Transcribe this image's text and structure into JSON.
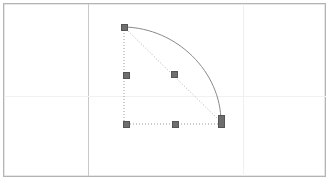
{
  "app": {
    "name": "vector-drawing-canvas",
    "background_color": "#ffffff"
  },
  "page": {
    "frame": {
      "x": 3,
      "y": 3,
      "width": 323,
      "height": 174
    },
    "border_color": "#b4b4b4",
    "fill_color": "#ffffff"
  },
  "guides": {
    "vertical": [
      {
        "name": "margin-guide-left",
        "x": 88,
        "color": "#c8c8c8",
        "prominent": true
      },
      {
        "name": "margin-guide-right",
        "x": 243,
        "color": "#f0f0f0",
        "prominent": false
      }
    ],
    "horizontal": [
      {
        "name": "margin-guide-middle",
        "y": 96,
        "color": "#f1f1f1",
        "prominent": false
      }
    ]
  },
  "shape": {
    "name": "quarter-arc-path",
    "type": "bezier-arc",
    "stroke_color": "#8a8a8a",
    "stroke_width": 1,
    "fill": "none",
    "start_point": {
      "x": 124,
      "y": 27
    },
    "end_point": {
      "x": 221,
      "y": 122
    },
    "control_point_1": {
      "x": 177,
      "y": 28
    },
    "control_point_2": {
      "x": 221,
      "y": 72
    }
  },
  "selection": {
    "name": "selection-overlay",
    "bounding_box": {
      "x": 124,
      "y": 27,
      "width": 97,
      "height": 97
    },
    "dotted_color": "#9a9a9a",
    "diagonal_guide": {
      "name": "chord-guide",
      "from": {
        "x": 124,
        "y": 27
      },
      "to": {
        "x": 221,
        "y": 122
      },
      "color": "#b0b0b0"
    },
    "handles": [
      {
        "name": "handle-top-left",
        "x": 124,
        "y": 27,
        "tall": false
      },
      {
        "name": "handle-middle-left",
        "x": 126,
        "y": 75,
        "tall": false
      },
      {
        "name": "handle-bottom-left",
        "x": 126,
        "y": 124,
        "tall": false
      },
      {
        "name": "handle-bottom-middle",
        "x": 175,
        "y": 124,
        "tall": false
      },
      {
        "name": "handle-bottom-right",
        "x": 221,
        "y": 121,
        "tall": true
      },
      {
        "name": "handle-chord-midpoint",
        "x": 174,
        "y": 74,
        "tall": false
      }
    ]
  },
  "colors": {
    "handle_fill": "#6e6e6e",
    "handle_border": "#555555",
    "curve_stroke": "#8a8a8a",
    "frame_border": "#b4b4b4",
    "guide_strong": "#c8c8c8",
    "guide_faint": "#f0f0f0"
  }
}
